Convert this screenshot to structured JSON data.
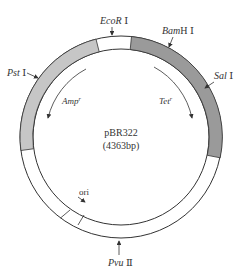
{
  "diagram": {
    "title": "pBR322",
    "size_label": "(4363bp)",
    "colors": {
      "ring_stroke": "#333333",
      "amp_segment": "#c6c6c6",
      "tet_segment": "#9a9a9a",
      "empty_segment": "#ffffff"
    },
    "restriction_sites": [
      {
        "name": "EcoR",
        "suffix": " Ⅰ"
      },
      {
        "name": "Bam",
        "tail": "H",
        "suffix": " Ⅰ"
      },
      {
        "name": "Sal",
        "suffix": " Ⅰ"
      },
      {
        "name": "Pst",
        "suffix": " Ⅰ"
      },
      {
        "name": "Pvu",
        "suffix": " Ⅱ"
      }
    ],
    "genes": [
      {
        "name": "Amp",
        "superscript": "r"
      },
      {
        "name": "Tet",
        "superscript": "r"
      }
    ],
    "origin_label": "ori"
  }
}
